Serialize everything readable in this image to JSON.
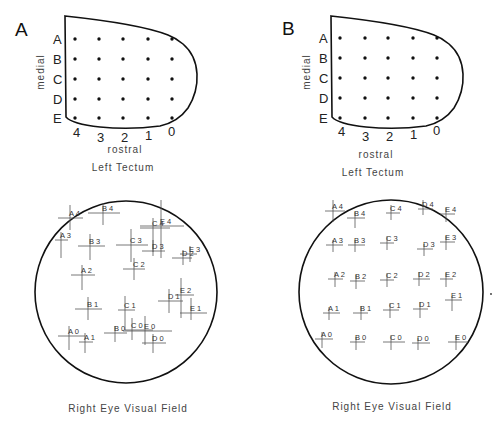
{
  "panels": [
    {
      "id": "A",
      "letter": "A",
      "letter_pos": [
        15,
        36
      ],
      "tectum": {
        "outline_path": "M65,16 L66,117 Q72,124 100,127 Q130,130 160,126 Q178,122 188,108 Q198,92 197,74 Q196,55 183,44 Q176,38 168,35 Q140,24 65,16 Z",
        "rows": [
          "A",
          "B",
          "C",
          "D",
          "E"
        ],
        "cols": [
          "4",
          "3",
          "2",
          "1",
          "0"
        ],
        "dot_x": [
          75,
          99,
          123,
          148,
          172
        ],
        "dot_y": [
          39,
          59,
          79,
          99,
          118
        ],
        "row_label_x": 53,
        "col_label_pos": [
          [
            73,
            137
          ],
          [
            97,
            142
          ],
          [
            121,
            142
          ],
          [
            145,
            140
          ],
          [
            168,
            136
          ]
        ],
        "medial_label": "medial",
        "medial_pos": [
          44,
          72
        ],
        "rostral_label": "rostral",
        "rostral_pos": [
          125,
          153
        ],
        "title": "Left Tectum",
        "title_pos": [
          123,
          171
        ]
      },
      "visual_field": {
        "center": [
          126,
          292
        ],
        "radius": 91,
        "caption": "Right Eye Visual Field",
        "caption_pos": [
          128,
          412
        ],
        "marks": [
          {
            "label": "A 4",
            "x": 70,
            "y": 218,
            "h": [
              58,
              83
            ],
            "v": [
              205,
              230
            ]
          },
          {
            "label": "B 4",
            "x": 103,
            "y": 213,
            "h": [
              88,
              120
            ],
            "v": [
              203,
              225
            ]
          },
          {
            "label": "A 3",
            "x": 61,
            "y": 240,
            "h": [
              55,
              68
            ],
            "v": [
              232,
              258
            ]
          },
          {
            "label": "B 3",
            "x": 90,
            "y": 246,
            "h": [
              78,
              105
            ],
            "v": [
              234,
              260
            ]
          },
          {
            "label": "C 3",
            "x": 131,
            "y": 245,
            "h": [
              116,
              148
            ],
            "v": [
              229,
              262
            ]
          },
          {
            "label": "C 4",
            "x": 153,
            "y": 228,
            "h": [
              140,
              170
            ],
            "v": [
              218,
              252
            ]
          },
          {
            "label": "E 4",
            "x": 161,
            "y": 226,
            "h": [
              140,
              184
            ],
            "v": [
              200,
              258
            ]
          },
          {
            "label": "D 3",
            "x": 153,
            "y": 251,
            "h": [
              142,
              165
            ],
            "v": [
              240,
              256
            ]
          },
          {
            "label": "D 2",
            "x": 183,
            "y": 258,
            "h": [
              172,
              192
            ],
            "v": [
              250,
              265
            ]
          },
          {
            "label": "E 3",
            "x": 190,
            "y": 254,
            "h": [
              180,
              197
            ],
            "v": [
              246,
              262
            ]
          },
          {
            "label": "A 2",
            "x": 82,
            "y": 275,
            "h": [
              71,
              95
            ],
            "v": [
              265,
              290
            ]
          },
          {
            "label": "C 2",
            "x": 134,
            "y": 269,
            "h": [
              123,
              145
            ],
            "v": [
              258,
              280
            ]
          },
          {
            "label": "B 1",
            "x": 88,
            "y": 309,
            "h": [
              75,
              102
            ],
            "v": [
              297,
              320
            ]
          },
          {
            "label": "C 1",
            "x": 125,
            "y": 310,
            "h": [
              118,
              135
            ],
            "v": [
              296,
              330
            ]
          },
          {
            "label": "D 1",
            "x": 169,
            "y": 301,
            "h": [
              158,
              183
            ],
            "v": [
              289,
              313
            ]
          },
          {
            "label": "E 2",
            "x": 181,
            "y": 295,
            "h": [
              175,
              194
            ],
            "v": [
              278,
              318
            ]
          },
          {
            "label": "E 1",
            "x": 191,
            "y": 313,
            "h": [
              180,
              207
            ],
            "v": [
              298,
              320
            ]
          },
          {
            "label": "A 0",
            "x": 69,
            "y": 336,
            "h": [
              58,
              85
            ],
            "v": [
              326,
              350
            ]
          },
          {
            "label": "A 1",
            "x": 85,
            "y": 342,
            "h": [
              79,
              93
            ],
            "v": [
              333,
              353
            ]
          },
          {
            "label": "B 0",
            "x": 115,
            "y": 333,
            "h": [
              104,
              127
            ],
            "v": [
              326,
              342
            ]
          },
          {
            "label": "C 0",
            "x": 132,
            "y": 330,
            "h": [
              125,
              153
            ],
            "v": [
              318,
              340
            ]
          },
          {
            "label": "E 0",
            "x": 145,
            "y": 331,
            "h": [
              123,
              172
            ],
            "v": [
              316,
              345
            ]
          },
          {
            "label": "D 0",
            "x": 153,
            "y": 343,
            "h": [
              142,
              166
            ],
            "v": [
              334,
              353
            ]
          }
        ]
      }
    },
    {
      "id": "B",
      "letter": "B",
      "letter_pos": [
        282,
        35
      ],
      "tectum": {
        "outline_path": "M331,16 L332,117 Q338,124 366,127 Q396,130 426,126 Q444,122 454,108 Q464,92 463,74 Q462,55 449,44 Q442,38 434,35 Q406,24 331,16 Z",
        "rows": [
          "A",
          "B",
          "C",
          "D",
          "E"
        ],
        "cols": [
          "4",
          "3",
          "2",
          "1",
          "0"
        ],
        "dot_x": [
          340,
          365,
          388,
          413,
          437
        ],
        "dot_y": [
          38,
          58,
          78,
          98,
          118
        ],
        "row_label_x": 319,
        "col_label_pos": [
          [
            338,
            136
          ],
          [
            362,
            141
          ],
          [
            386,
            141
          ],
          [
            410,
            139
          ],
          [
            433,
            135
          ]
        ],
        "medial_label": "medial",
        "medial_pos": [
          310,
          72
        ],
        "rostral_label": "rostral",
        "rostral_pos": [
          376,
          158
        ],
        "title": "Left Tectum",
        "title_pos": [
          373,
          176
        ]
      },
      "visual_field": {
        "center": [
          391,
          292
        ],
        "radius": 92,
        "caption": "Right Eye Visual Field",
        "caption_pos": [
          392,
          410
        ],
        "marks": [
          {
            "label": "A 4",
            "x": 333,
            "y": 211,
            "h": [
              325,
              345
            ],
            "v": [
              200,
              222
            ]
          },
          {
            "label": "B 4",
            "x": 355,
            "y": 218,
            "h": [
              347,
              365
            ],
            "v": [
              212,
              228
            ]
          },
          {
            "label": "C 4",
            "x": 391,
            "y": 213,
            "h": [
              386,
              400
            ],
            "v": [
              205,
              220
            ]
          },
          {
            "label": "D 4",
            "x": 423,
            "y": 209,
            "h": [
              418,
              433
            ],
            "v": [
              200,
              215
            ]
          },
          {
            "label": "E 4",
            "x": 446,
            "y": 214,
            "h": [
              440,
              455
            ],
            "v": [
              208,
              222
            ]
          },
          {
            "label": "A 3",
            "x": 333,
            "y": 245,
            "h": [
              326,
              343
            ],
            "v": [
              240,
              252
            ]
          },
          {
            "label": "B 3",
            "x": 355,
            "y": 245,
            "h": [
              348,
              365
            ],
            "v": [
              240,
              252
            ]
          },
          {
            "label": "C 3",
            "x": 387,
            "y": 243,
            "h": [
              380,
              394
            ],
            "v": [
              236,
              250
            ]
          },
          {
            "label": "D 3",
            "x": 424,
            "y": 249,
            "h": [
              417,
              433
            ],
            "v": [
              244,
              256
            ]
          },
          {
            "label": "E 3",
            "x": 446,
            "y": 242,
            "h": [
              440,
              455
            ],
            "v": [
              236,
              250
            ]
          },
          {
            "label": "A 2",
            "x": 335,
            "y": 279,
            "h": [
              328,
              343
            ],
            "v": [
              272,
              287
            ]
          },
          {
            "label": "B 2",
            "x": 356,
            "y": 281,
            "h": [
              350,
              365
            ],
            "v": [
              275,
              289
            ]
          },
          {
            "label": "C 2",
            "x": 387,
            "y": 280,
            "h": [
              380,
              394
            ],
            "v": [
              273,
              287
            ]
          },
          {
            "label": "D 2",
            "x": 419,
            "y": 279,
            "h": [
              413,
              430
            ],
            "v": [
              272,
              286
            ]
          },
          {
            "label": "E 2",
            "x": 446,
            "y": 279,
            "h": [
              440,
              453
            ],
            "v": [
              273,
              287
            ]
          },
          {
            "label": "A 1",
            "x": 329,
            "y": 313,
            "h": [
              323,
              340
            ],
            "v": [
              307,
              320
            ]
          },
          {
            "label": "B 1",
            "x": 361,
            "y": 313,
            "h": [
              353,
              368
            ],
            "v": [
              306,
              320
            ]
          },
          {
            "label": "C 1",
            "x": 390,
            "y": 310,
            "h": [
              383,
              399
            ],
            "v": [
              303,
              318
            ]
          },
          {
            "label": "D 1",
            "x": 420,
            "y": 309,
            "h": [
              413,
              428
            ],
            "v": [
              302,
              318
            ]
          },
          {
            "label": "E 1",
            "x": 452,
            "y": 300,
            "h": [
              445,
              462
            ],
            "v": [
              296,
              311
            ]
          },
          {
            "label": "A 0",
            "x": 322,
            "y": 339,
            "h": [
              315,
              333
            ],
            "v": [
              332,
              348
            ]
          },
          {
            "label": "B 0",
            "x": 356,
            "y": 342,
            "h": [
              350,
              365
            ],
            "v": [
              337,
              350
            ]
          },
          {
            "label": "C 0",
            "x": 391,
            "y": 342,
            "h": [
              383,
              405
            ],
            "v": [
              335,
              350
            ]
          },
          {
            "label": "D 0",
            "x": 418,
            "y": 343,
            "h": [
              412,
              430
            ],
            "v": [
              338,
              350
            ]
          },
          {
            "label": "E 0",
            "x": 456,
            "y": 342,
            "h": [
              448,
              468
            ],
            "v": [
              335,
              350
            ]
          }
        ]
      }
    }
  ],
  "stray_dot": [
    491,
    294
  ],
  "colors": {
    "ink": "#111111",
    "cross": "#555555",
    "text": "#444444",
    "background": "#ffffff"
  }
}
